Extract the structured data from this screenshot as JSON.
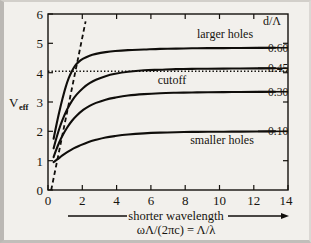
{
  "figure": {
    "background_color": "#f2f0ec",
    "ink_color": "#100e0b"
  },
  "axes": {
    "y_label_main": "V",
    "y_label_sub": "eff",
    "x_tick_labels": [
      "0",
      "2",
      "4",
      "6",
      "8",
      "10",
      "12",
      "14"
    ],
    "y_tick_labels": [
      "0",
      "1",
      "2",
      "3",
      "4",
      "5",
      "6"
    ],
    "x_caption": "shorter wavelength",
    "x_formula": "ωΛ/(2πc) = Λ/λ",
    "legend_header": "d/Λ"
  },
  "annotations": {
    "cutoff": "cutoff",
    "larger_holes": "larger holes",
    "smaller_holes": "smaller holes"
  },
  "chart_data": {
    "type": "line",
    "title": "",
    "xlabel": "ωΛ/(2πc) = Λ/λ",
    "ylabel": "V_eff",
    "xlim": [
      0,
      15
    ],
    "ylim": [
      0,
      6
    ],
    "xticks": [
      0,
      2,
      4,
      6,
      8,
      10,
      12,
      14
    ],
    "yticks": [
      0,
      1,
      2,
      3,
      4,
      5,
      6
    ],
    "grid": false,
    "legend_position": "right",
    "legend_title": "d/Λ",
    "cutoff_value": 4.05,
    "cutoff_label": "cutoff",
    "asymptote": {
      "label": "",
      "style": "dashed",
      "x": [
        0.2,
        2.35
      ],
      "y": [
        0.0,
        5.75
      ]
    },
    "series": [
      {
        "name": "0.60",
        "label": "0.60",
        "plateau": 4.85,
        "x": [
          0.35,
          0.5,
          0.7,
          0.9,
          1.1,
          1.3,
          1.5,
          1.7,
          1.9,
          2.2,
          2.6,
          3.0,
          3.6,
          4.2,
          5.0,
          6.0,
          7.0,
          8.0,
          9.0,
          10.0,
          11.5,
          13.0,
          14.2
        ],
        "y": [
          1.75,
          2.15,
          2.65,
          3.1,
          3.5,
          3.82,
          4.06,
          4.24,
          4.36,
          4.48,
          4.58,
          4.64,
          4.7,
          4.74,
          4.77,
          4.79,
          4.81,
          4.82,
          4.83,
          4.835,
          4.84,
          4.845,
          4.85
        ]
      },
      {
        "name": "0.45",
        "label": "0.45",
        "plateau": 4.15,
        "x": [
          0.35,
          0.5,
          0.7,
          0.9,
          1.2,
          1.5,
          1.8,
          2.2,
          2.6,
          3.0,
          3.6,
          4.2,
          5.0,
          6.0,
          7.0,
          8.0,
          9.0,
          10.0,
          11.5,
          13.0,
          14.2
        ],
        "y": [
          1.42,
          1.72,
          2.08,
          2.38,
          2.75,
          3.04,
          3.26,
          3.48,
          3.64,
          3.76,
          3.88,
          3.96,
          4.03,
          4.08,
          4.1,
          4.12,
          4.13,
          4.135,
          4.14,
          4.145,
          4.15
        ]
      },
      {
        "name": "0.30",
        "label": "0.30",
        "plateau": 3.35,
        "x": [
          0.35,
          0.5,
          0.7,
          0.9,
          1.2,
          1.5,
          1.8,
          2.2,
          2.6,
          3.0,
          3.6,
          4.2,
          5.0,
          6.0,
          7.0,
          8.0,
          9.0,
          10.0,
          11.5,
          13.0,
          14.2
        ],
        "y": [
          1.12,
          1.35,
          1.62,
          1.85,
          2.13,
          2.36,
          2.54,
          2.73,
          2.87,
          2.97,
          3.08,
          3.15,
          3.22,
          3.27,
          3.3,
          3.315,
          3.325,
          3.33,
          3.34,
          3.345,
          3.35
        ]
      },
      {
        "name": "0.10",
        "label": "0.10",
        "plateau": 2.0,
        "x": [
          0.35,
          0.6,
          0.9,
          1.2,
          1.6,
          2.0,
          2.5,
          3.0,
          3.6,
          4.2,
          5.0,
          6.0,
          7.0,
          8.0,
          9.0,
          10.0,
          11.5,
          13.0,
          14.2
        ],
        "y": [
          0.95,
          1.05,
          1.18,
          1.29,
          1.42,
          1.52,
          1.63,
          1.71,
          1.79,
          1.84,
          1.89,
          1.93,
          1.955,
          1.97,
          1.98,
          1.985,
          1.99,
          1.995,
          2.0
        ]
      }
    ]
  }
}
